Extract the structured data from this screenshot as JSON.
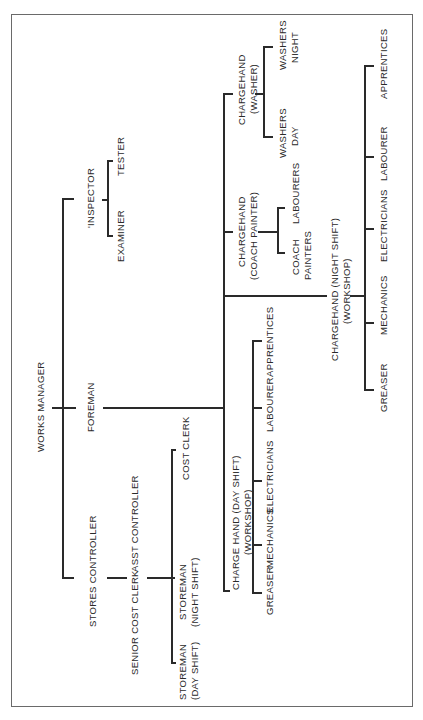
{
  "chart": {
    "nodes": {
      "works_manager": "WORKS MANAGER",
      "foreman": "FOREMAN",
      "inspector": "'INSPECTOR",
      "examiner": "EXAMINER",
      "tester": "TESTER",
      "stores_controller": "STORES CONTROLLER",
      "senior_cost_clerk": "SENIOR COST CLERK",
      "asst_controller": "ASST CONTROLLER",
      "storeman_day_1": "STOREMAN",
      "storeman_day_2": "(DAY SHIFT)",
      "storeman_night_1": "STOREMAN",
      "storeman_night_2": "(NIGHT SHIFT)",
      "cost_clerk": "COST CLERK",
      "chargehand_day_1": "CHARGE HAND (DAY SHIFT)",
      "chargehand_day_2": "(WORKSHOP)",
      "day_greaser": "GREASER",
      "day_mechanics": "MECHANICS",
      "day_electricians": "ELECTRICIANS",
      "day_labourer": "LABOURER",
      "day_apprentices": "APPRENTICES",
      "chargehand_night_1": "CHARGEHAND (NIGHT SHIFT)",
      "chargehand_night_2": "(WORKSHOP)",
      "night_greaser": "GREASER",
      "night_mechanics": "MECHANICS",
      "night_electricians": "ELECTRICIANS",
      "night_labourer": "LABOURER",
      "night_apprentices": "APPRENTICES",
      "chargehand_coach_1": "CHARGEHAND",
      "chargehand_coach_2": "(COACH PAINTER)",
      "coach_painters_1": "COACH",
      "coach_painters_2": "PAINTERS",
      "coach_labourers": "LABOURERS",
      "chargehand_washer_1": "CHARGEHAND",
      "chargehand_washer_2": "(WASHER)",
      "washers_day_1": "WASHERS",
      "washers_day_2": "DAY",
      "washers_night_1": "WASHERS",
      "washers_night_2": "NIGHT"
    }
  }
}
